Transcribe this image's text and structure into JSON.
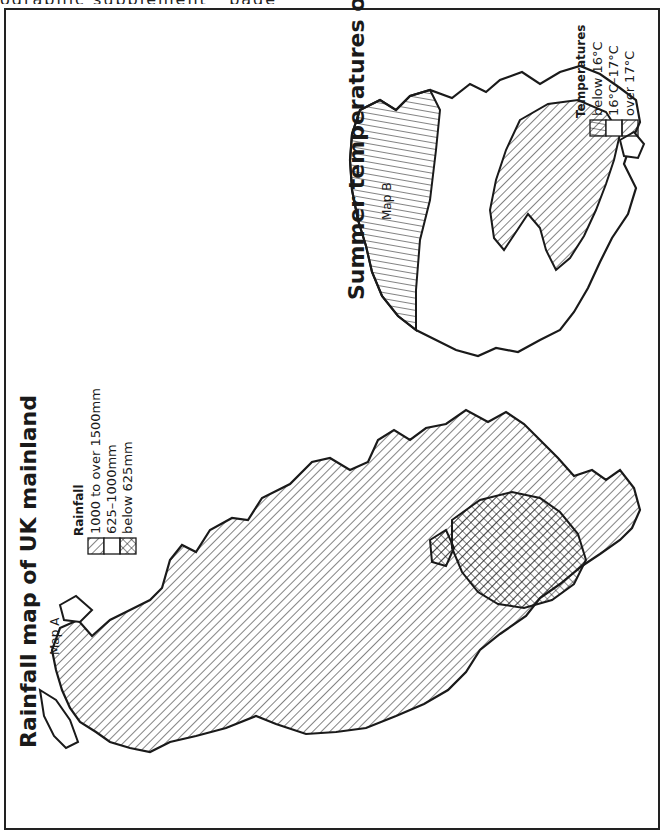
{
  "page": {
    "top_fragment": "ographic supplement · page"
  },
  "map_a": {
    "title": "Rainfall map of UK mainland",
    "label": "Map A",
    "legend": {
      "title": "Rainfall",
      "items": [
        {
          "label": "1000 to over 1500mm",
          "pattern": "diagonal-hatch"
        },
        {
          "label": "625–1000mm",
          "pattern": "blank"
        },
        {
          "label": "below 625mm",
          "pattern": "cross-hatch"
        }
      ]
    }
  },
  "map_b": {
    "title": "Summer temperatures  on UK mainland",
    "label": "Map B",
    "legend": {
      "title": "Temperatures",
      "items": [
        {
          "label": "below 16°C",
          "pattern": "line-hatch"
        },
        {
          "label": "16°C–17°C",
          "pattern": "blank"
        },
        {
          "label": "over 17°C",
          "pattern": "diagonal-hatch"
        }
      ]
    }
  },
  "colors": {
    "ink": "#1a1a1a",
    "paper": "#ffffff"
  }
}
